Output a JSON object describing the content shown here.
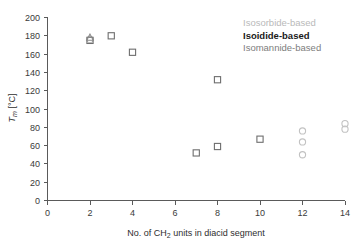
{
  "chart_data": {
    "type": "scatter",
    "title": "",
    "xlabel": "No. of CH2 units in diacid segment",
    "xlabel_parts": {
      "pre": "No. of CH",
      "sub": "2",
      "post": " units in diacid segment"
    },
    "ylabel": "Tm [°C]",
    "ylabel_parts": {
      "pre": "T",
      "sub": "m",
      "post": " [°C]"
    },
    "xlim": [
      0,
      14
    ],
    "ylim": [
      0,
      200
    ],
    "xticks": [
      0,
      2,
      4,
      6,
      8,
      10,
      12,
      14
    ],
    "yticks": [
      0,
      20,
      40,
      60,
      80,
      100,
      120,
      140,
      160,
      180,
      200
    ],
    "grid": false,
    "legend_position": "top-right",
    "series": [
      {
        "name": "Isosorbide-based",
        "marker": "circle",
        "color": "#c2c2c2",
        "points": [
          {
            "x": 2,
            "y": 176
          },
          {
            "x": 12,
            "y": 76
          },
          {
            "x": 12,
            "y": 64
          },
          {
            "x": 12,
            "y": 50
          },
          {
            "x": 14,
            "y": 84
          },
          {
            "x": 14,
            "y": 78
          }
        ]
      },
      {
        "name": "Isoidide-based",
        "marker": "square",
        "color": "#6e6e6e",
        "points": [
          {
            "x": 2,
            "y": 175
          },
          {
            "x": 3,
            "y": 180
          },
          {
            "x": 4,
            "y": 162
          },
          {
            "x": 7,
            "y": 52
          },
          {
            "x": 8,
            "y": 132
          },
          {
            "x": 8,
            "y": 59
          },
          {
            "x": 10,
            "y": 67
          }
        ]
      },
      {
        "name": "Isomannide-based",
        "marker": "triangle",
        "color": "#8a8a8a",
        "points": [
          {
            "x": 2,
            "y": 178
          }
        ]
      }
    ]
  },
  "legend": {
    "entries": [
      {
        "label": "Isosorbide-based",
        "color": "#b9b9b9"
      },
      {
        "label": "Isoidide-based",
        "color": "#1a1a1a"
      },
      {
        "label": "Isomannide-based",
        "color": "#7d7d7d"
      }
    ]
  },
  "axes": {
    "y_tick_labels": [
      "200",
      "180",
      "160",
      "140",
      "120",
      "100",
      "80",
      "60",
      "40",
      "20",
      "0"
    ],
    "x_tick_labels": [
      "0",
      "2",
      "4",
      "6",
      "8",
      "10",
      "12",
      "14"
    ],
    "y_title_main": "T",
    "y_title_sub": "m",
    "y_title_unit": " [°C]",
    "x_title_pre": "No. of CH",
    "x_title_sub": "2",
    "x_title_post": " units in diacid segment"
  }
}
